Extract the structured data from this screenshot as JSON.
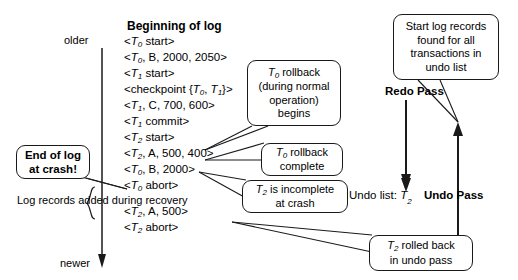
{
  "diagram": {
    "axis": {
      "older_label": "older",
      "newer_label": "newer"
    },
    "log": {
      "heading": "Beginning of log",
      "entries": [
        {
          "id": "t0-start",
          "text": "<T0 start>",
          "txn": "T",
          "sub": "0",
          "rest": " start>"
        },
        {
          "id": "t0-b-update",
          "text": "<T0, B, 2000, 2050>",
          "txn": "T",
          "sub": "0",
          "rest": ", B, 2000, 2050>"
        },
        {
          "id": "t1-start",
          "text": "<T1 start>",
          "txn": "T",
          "sub": "1",
          "rest": " start>"
        },
        {
          "id": "checkpoint",
          "text": "<checkpoint {T0, T1}>",
          "txn": "",
          "sub": "",
          "rest": ""
        },
        {
          "id": "t1-c-update",
          "text": "<T1, C, 700, 600>",
          "txn": "T",
          "sub": "1",
          "rest": ", C, 700, 600>"
        },
        {
          "id": "t1-commit",
          "text": "<T1 commit>",
          "txn": "T",
          "sub": "1",
          "rest": " commit>"
        },
        {
          "id": "t2-start",
          "text": "<T2 start>",
          "txn": "T",
          "sub": "2",
          "rest": " start>"
        },
        {
          "id": "t2-a-update",
          "text": "<T2, A, 500, 400>",
          "txn": "T",
          "sub": "2",
          "rest": ", A, 500, 400>"
        },
        {
          "id": "t0-b-compen",
          "text": "<T0, B, 2000>",
          "txn": "T",
          "sub": "0",
          "rest": ", B, 2000>"
        },
        {
          "id": "t0-abort",
          "text": "<T0 abort>",
          "txn": "T",
          "sub": "0",
          "rest": " abort>"
        },
        {
          "id": "t2-a-compen",
          "text": "<T2, A, 500>",
          "txn": "T",
          "sub": "2",
          "rest": ", A, 500>"
        },
        {
          "id": "t2-abort",
          "text": "<T2 abort>",
          "txn": "T",
          "sub": "2",
          "rest": " abort>"
        }
      ],
      "checkpoint_prefix": "<checkpoint {",
      "checkpoint_t0": "T",
      "checkpoint_t0_sub": "0",
      "checkpoint_mid": ", ",
      "checkpoint_t1": "T",
      "checkpoint_t1_sub": "1",
      "checkpoint_suffix": "}>"
    },
    "recovery_note": "Log records added during recovery",
    "callouts": {
      "end_of_log": "End of log at crash!",
      "t0_rollback": "T0 rollback (during normal operation) begins",
      "t0_rollback_line1_txn": "T",
      "t0_rollback_line1_sub": "0",
      "t0_rollback_line1_rest": " rollback",
      "t0_rollback_line2": "(during normal",
      "t0_rollback_line3": "operation)",
      "t0_rollback_line4": "begins",
      "t0_complete_txn": "T",
      "t0_complete_sub": "0",
      "t0_complete_rest": " rollback",
      "t0_complete_line2": "complete",
      "t2_incomplete_txn": "T",
      "t2_incomplete_sub": "2",
      "t2_incomplete_rest": " is incomplete",
      "t2_incomplete_line2": "at crash",
      "start_records_line1": "Start log records",
      "start_records_line2": "found for all",
      "start_records_line3": "transactions in",
      "start_records_line4": "undo list",
      "t2_rolled_txn": "T",
      "t2_rolled_sub": "2",
      "t2_rolled_rest": " rolled back",
      "t2_rolled_line2": "in undo pass"
    },
    "passes": {
      "redo_label": "Redo Pass",
      "undo_label": "Undo Pass"
    },
    "undo_list": {
      "prefix": "Undo list: ",
      "txn": "T",
      "sub": "2"
    },
    "colors": {
      "ink": "#000000",
      "background": "#ffffff",
      "stroke": "#1a1a1a"
    }
  }
}
